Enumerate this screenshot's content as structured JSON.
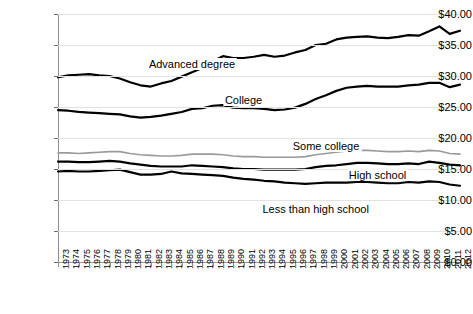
{
  "chart_data": {
    "type": "line",
    "title": "",
    "xlabel": "",
    "ylabel": "",
    "ylim": [
      0,
      40
    ],
    "ytick_step": 5,
    "ytick_labels": [
      "$40.00",
      "$35.00",
      "$30.00",
      "$25.00",
      "$20.00",
      "$15.00",
      "$10.00",
      "$5.00",
      "$0.00"
    ],
    "ytick_values": [
      40,
      35,
      30,
      25,
      20,
      15,
      10,
      5,
      0
    ],
    "grid": true,
    "legend_position": "inline-labels",
    "x": [
      1973,
      1974,
      1975,
      1976,
      1977,
      1978,
      1979,
      1980,
      1981,
      1982,
      1983,
      1984,
      1985,
      1986,
      1987,
      1988,
      1989,
      1990,
      1991,
      1992,
      1993,
      1994,
      1995,
      1996,
      1997,
      1998,
      1999,
      2000,
      2001,
      2002,
      2003,
      2004,
      2005,
      2006,
      2007,
      2008,
      2009,
      2010,
      2011,
      2012
    ],
    "categories": [
      "1973",
      "1974",
      "1975",
      "1976",
      "1977",
      "1978",
      "1979",
      "1980",
      "1981",
      "1982",
      "1983",
      "1984",
      "1985",
      "1986",
      "1987",
      "1988",
      "1989",
      "1990",
      "1991",
      "1992",
      "1993",
      "1994",
      "1995",
      "1996",
      "1997",
      "1998",
      "1999",
      "2000",
      "2001",
      "2002",
      "2003",
      "2004",
      "2005",
      "2006",
      "2007",
      "2008",
      "2009",
      "2010",
      "2011",
      "2012"
    ],
    "series": [
      {
        "name": "Advanced degree",
        "color": "#000000",
        "label_x_year": 1986,
        "values": [
          29.8,
          30.1,
          30.2,
          30.3,
          30.1,
          30.0,
          29.6,
          29.0,
          28.5,
          28.3,
          28.8,
          29.2,
          29.9,
          30.6,
          31.3,
          32.4,
          33.2,
          32.9,
          32.9,
          33.1,
          33.4,
          33.1,
          33.3,
          33.8,
          34.2,
          35.0,
          35.2,
          35.9,
          36.2,
          36.3,
          36.4,
          36.2,
          36.1,
          36.3,
          36.6,
          36.5,
          37.2,
          38.0,
          36.8,
          37.3
        ]
      },
      {
        "name": "College",
        "color": "#000000",
        "label_x_year": 1991,
        "values": [
          24.5,
          24.4,
          24.2,
          24.1,
          24.0,
          23.9,
          23.8,
          23.5,
          23.3,
          23.4,
          23.6,
          23.9,
          24.2,
          24.7,
          24.8,
          25.2,
          25.3,
          24.9,
          24.8,
          24.8,
          24.7,
          24.5,
          24.6,
          24.9,
          25.5,
          26.3,
          26.9,
          27.6,
          28.1,
          28.3,
          28.4,
          28.3,
          28.3,
          28.3,
          28.5,
          28.6,
          28.9,
          28.9,
          28.2,
          28.6
        ]
      },
      {
        "name": "Some college",
        "color": "#9a9a9a",
        "label_x_year": 1999,
        "values": [
          17.6,
          17.6,
          17.5,
          17.6,
          17.7,
          17.8,
          17.8,
          17.5,
          17.3,
          17.2,
          17.1,
          17.1,
          17.2,
          17.4,
          17.4,
          17.4,
          17.3,
          17.1,
          17.0,
          17.0,
          16.9,
          16.9,
          16.9,
          16.9,
          17.0,
          17.3,
          17.5,
          17.7,
          17.9,
          18.0,
          18.0,
          17.9,
          17.8,
          17.8,
          17.9,
          17.8,
          18.0,
          17.9,
          17.5,
          17.4
        ]
      },
      {
        "name": "High school",
        "color": "#000000",
        "label_x_year": 2004,
        "values": [
          16.2,
          16.2,
          16.1,
          16.1,
          16.2,
          16.3,
          16.2,
          15.9,
          15.7,
          15.5,
          15.4,
          15.4,
          15.4,
          15.6,
          15.5,
          15.4,
          15.3,
          15.1,
          15.0,
          15.0,
          14.9,
          14.9,
          14.9,
          14.9,
          15.0,
          15.3,
          15.5,
          15.6,
          15.8,
          16.0,
          16.0,
          15.9,
          15.8,
          15.8,
          15.9,
          15.8,
          16.2,
          16.0,
          15.7,
          15.6
        ]
      },
      {
        "name": "Less than high school",
        "color": "#000000",
        "label_x_year": 1998,
        "values": [
          14.6,
          14.7,
          14.6,
          14.6,
          14.7,
          14.8,
          14.9,
          14.5,
          14.1,
          14.1,
          14.2,
          14.6,
          14.3,
          14.2,
          14.1,
          14.0,
          13.9,
          13.6,
          13.4,
          13.3,
          13.1,
          13.0,
          12.8,
          12.7,
          12.6,
          12.7,
          12.8,
          12.8,
          12.8,
          12.9,
          12.9,
          12.8,
          12.7,
          12.7,
          12.9,
          12.8,
          13.0,
          12.9,
          12.5,
          12.3
        ]
      }
    ]
  }
}
